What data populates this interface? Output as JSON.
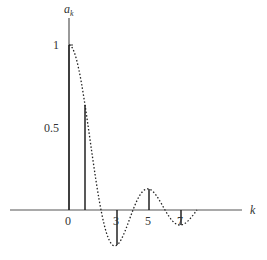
{
  "chart_data": {
    "type": "line",
    "subtype": "stem-with-envelope",
    "title": "",
    "xlabel": "k",
    "ylabel": "a_k",
    "ylabel_main": "a",
    "ylabel_sub": "k",
    "x_tick_labels": [
      {
        "k": 0,
        "label": "0"
      },
      {
        "k": 3,
        "label": "3"
      },
      {
        "k": 5,
        "label": "5"
      },
      {
        "k": 7,
        "label": "7"
      }
    ],
    "y_tick_labels": [
      {
        "y": 1,
        "label": "1"
      },
      {
        "y": 0.5,
        "label": "0.5"
      }
    ],
    "stems": [
      {
        "k": 0,
        "value": 1.0
      },
      {
        "k": 1,
        "value": 0.637
      },
      {
        "k": 3,
        "value": -0.212
      },
      {
        "k": 5,
        "value": 0.127
      },
      {
        "k": 7,
        "value": -0.091
      }
    ],
    "envelope": {
      "style": "dotted",
      "formula": "sin(pi*k/2)/(pi*k/2)",
      "k_range": [
        0,
        8
      ]
    },
    "grid": false,
    "legend": null,
    "xlim": [
      -3.7,
      11.6
    ],
    "ylim": [
      -0.25,
      1.2
    ]
  },
  "layout": {
    "origin_x": 69,
    "origin_y": 210,
    "px_per_k": 16,
    "px_per_unit_y": 165,
    "x_axis_start": 10,
    "x_axis_end": 242,
    "y_axis_top": 18,
    "axis_color": "#555555",
    "stem_color": "#222222",
    "curve_color": "#222222"
  }
}
